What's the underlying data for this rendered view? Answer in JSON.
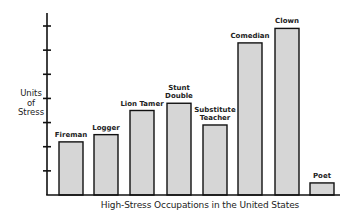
{
  "chart_data": {
    "type": "bar",
    "title": "",
    "xlabel": "High-Stress Occupations in the United States",
    "ylabel": "Units of Stress",
    "ylabel_lines": [
      "Units",
      "of",
      "Stress"
    ],
    "categories": [
      "Fireman",
      "Logger",
      "Lion Tamer",
      "Stunt Double",
      "Substitute Teacher",
      "Comedian",
      "Clown",
      "Poet"
    ],
    "category_label_lines": [
      [
        "Fireman"
      ],
      [
        "Logger"
      ],
      [
        "Lion Tamer"
      ],
      [
        "Stunt",
        "Double"
      ],
      [
        "Substitute",
        "Teacher"
      ],
      [
        "Comedian"
      ],
      [
        "Clown"
      ],
      [
        "Poet"
      ]
    ],
    "values": [
      2.2,
      2.5,
      3.5,
      3.8,
      2.9,
      6.3,
      6.9,
      0.5
    ],
    "ylim": [
      0,
      7
    ],
    "yticks": [
      1,
      2,
      3,
      4,
      5,
      6,
      7
    ],
    "ytick_labels_shown": false,
    "grid": false,
    "legend": null,
    "bar_fill": "#d6d6d6",
    "bar_stroke": "#111111"
  }
}
